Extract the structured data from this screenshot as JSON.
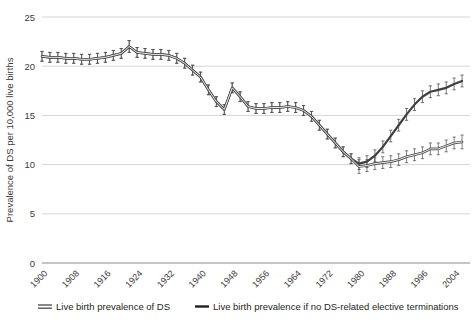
{
  "chart_data": {
    "type": "line",
    "title": "",
    "xlabel": "",
    "ylabel": "Prevalence of DS per 10,000 live births",
    "xlim": [
      1900,
      2008
    ],
    "ylim": [
      0,
      25
    ],
    "yticks": [
      0,
      5,
      10,
      15,
      20,
      25
    ],
    "xticks": [
      1900,
      1908,
      1916,
      1924,
      1932,
      1940,
      1948,
      1956,
      1964,
      1972,
      1980,
      1988,
      1996,
      2004
    ],
    "grid": true,
    "legend_position": "bottom",
    "error_bars": true,
    "x": [
      1900,
      1902,
      1904,
      1906,
      1908,
      1910,
      1912,
      1914,
      1916,
      1918,
      1920,
      1922,
      1924,
      1926,
      1928,
      1930,
      1932,
      1934,
      1936,
      1938,
      1940,
      1942,
      1944,
      1946,
      1948,
      1950,
      1952,
      1954,
      1956,
      1958,
      1960,
      1962,
      1964,
      1966,
      1968,
      1970,
      1972,
      1974,
      1976,
      1978,
      1980,
      1982,
      1984,
      1986,
      1988,
      1990,
      1992,
      1994,
      1996,
      1998,
      2000,
      2002,
      2004,
      2006
    ],
    "series": [
      {
        "name": "Live birth prevalence if no DS-related elective terminations",
        "color": "#3f3f3f",
        "style": "solid-thick",
        "values": [
          21.0,
          20.9,
          20.9,
          20.8,
          20.8,
          20.7,
          20.7,
          20.8,
          20.9,
          21.1,
          21.3,
          22.0,
          21.4,
          21.3,
          21.2,
          21.2,
          21.1,
          20.8,
          20.3,
          19.6,
          18.9,
          17.6,
          16.4,
          15.6,
          17.8,
          16.9,
          15.9,
          15.7,
          15.7,
          15.8,
          15.8,
          15.9,
          15.8,
          15.5,
          14.9,
          14.0,
          13.1,
          12.2,
          11.3,
          10.6,
          10.1,
          10.3,
          10.9,
          11.8,
          12.9,
          14.0,
          15.1,
          16.1,
          16.9,
          17.4,
          17.6,
          17.8,
          18.2,
          18.5
        ],
        "err": [
          0.5,
          0.5,
          0.5,
          0.5,
          0.5,
          0.5,
          0.5,
          0.5,
          0.5,
          0.5,
          0.5,
          0.6,
          0.5,
          0.5,
          0.5,
          0.5,
          0.5,
          0.5,
          0.5,
          0.5,
          0.5,
          0.5,
          0.5,
          0.5,
          0.5,
          0.5,
          0.5,
          0.5,
          0.5,
          0.5,
          0.5,
          0.5,
          0.5,
          0.5,
          0.5,
          0.5,
          0.5,
          0.5,
          0.5,
          0.5,
          0.6,
          0.6,
          0.6,
          0.6,
          0.6,
          0.6,
          0.6,
          0.6,
          0.6,
          0.6,
          0.6,
          0.6,
          0.6,
          0.6
        ]
      },
      {
        "name": "Live birth prevalence of DS",
        "color": "#4a4a4a",
        "style": "solid-thin-double",
        "values": [
          21.0,
          20.9,
          20.9,
          20.8,
          20.8,
          20.7,
          20.7,
          20.8,
          20.9,
          21.1,
          21.3,
          22.0,
          21.4,
          21.3,
          21.2,
          21.2,
          21.1,
          20.8,
          20.3,
          19.6,
          18.9,
          17.6,
          16.4,
          15.6,
          17.8,
          16.9,
          15.9,
          15.7,
          15.7,
          15.8,
          15.8,
          15.9,
          15.8,
          15.5,
          14.9,
          14.0,
          13.1,
          12.2,
          11.3,
          10.6,
          9.8,
          9.9,
          10.1,
          10.2,
          10.3,
          10.5,
          10.8,
          11.0,
          11.2,
          11.6,
          11.6,
          11.9,
          12.2,
          12.3
        ],
        "err": [
          0.5,
          0.5,
          0.5,
          0.5,
          0.5,
          0.5,
          0.5,
          0.5,
          0.5,
          0.5,
          0.5,
          0.6,
          0.5,
          0.5,
          0.5,
          0.5,
          0.5,
          0.5,
          0.5,
          0.5,
          0.5,
          0.5,
          0.5,
          0.5,
          0.5,
          0.5,
          0.5,
          0.5,
          0.5,
          0.5,
          0.5,
          0.5,
          0.5,
          0.5,
          0.5,
          0.5,
          0.5,
          0.5,
          0.5,
          0.5,
          0.7,
          0.6,
          0.6,
          0.6,
          0.6,
          0.6,
          0.6,
          0.6,
          0.6,
          0.6,
          0.6,
          0.6,
          0.6,
          0.7
        ]
      }
    ]
  },
  "legend": {
    "items": [
      {
        "label": "Live birth prevalence of DS",
        "marker": "double-line-swatch",
        "color": "#4a4a4a"
      },
      {
        "label": "Live birth prevalence if no DS-related elective terminations",
        "marker": "thick-line-swatch",
        "color": "#231f20"
      }
    ]
  }
}
